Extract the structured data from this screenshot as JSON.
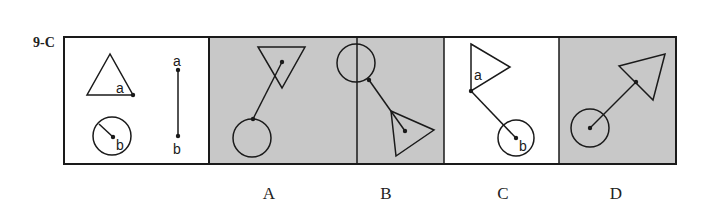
{
  "question": {
    "id": "9-C"
  },
  "colors": {
    "shaded": "#c8c8c8",
    "line": "#1a1a1a",
    "background": "#ffffff"
  },
  "prompt": {
    "description": "Triangle with point a on its lower-right vertex; circle with radius to center point b; line segment from a (top) to b (bottom)",
    "labels": {
      "a": "a",
      "b": "b"
    }
  },
  "options": [
    {
      "letter": "A",
      "shaded": true,
      "description": "Circle at bottom-left, line from circle edge to center of inverted triangle at top"
    },
    {
      "letter": "B",
      "shaded": true,
      "description": "Circle at top-left, line from circle edge to center of triangle pointing right at bottom"
    },
    {
      "letter": "C",
      "shaded": false,
      "description": "Triangle pointing right at top with a at left vertex, line to center b of circle at bottom",
      "labels": {
        "a": "a",
        "b": "b"
      }
    },
    {
      "letter": "D",
      "shaded": true,
      "description": "Circle center at bottom-left, line to edge of triangle at top-right"
    }
  ]
}
